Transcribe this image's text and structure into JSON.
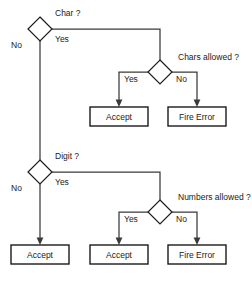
{
  "diagram": {
    "type": "flowchart",
    "background_color": "#ffffff",
    "line_color": "#3a3a3a",
    "shape_stroke_color": "#1a1a1a",
    "decisions": [
      {
        "id": "char",
        "label": "Char ?",
        "shape": "diamond"
      },
      {
        "id": "chars_allowed",
        "label": "Chars allowed ?",
        "shape": "diamond"
      },
      {
        "id": "digit",
        "label": "Digit ?",
        "shape": "diamond"
      },
      {
        "id": "numbers_allowed",
        "label": "Numbers allowed ?",
        "shape": "diamond"
      }
    ],
    "terminals": [
      {
        "id": "accept_chars",
        "label": "Accept",
        "shape": "rect"
      },
      {
        "id": "fire_error_chars",
        "label": "Fire Error",
        "shape": "rect"
      },
      {
        "id": "accept_no_digit",
        "label": "Accept",
        "shape": "rect"
      },
      {
        "id": "accept_numbers",
        "label": "Accept",
        "shape": "rect"
      },
      {
        "id": "fire_error_numbers",
        "label": "Fire Error",
        "shape": "rect"
      }
    ],
    "edges": [
      {
        "from": "char",
        "to": "digit",
        "label": "No"
      },
      {
        "from": "char",
        "to": "chars_allowed",
        "label": "Yes"
      },
      {
        "from": "chars_allowed",
        "to": "accept_chars",
        "label": "Yes"
      },
      {
        "from": "chars_allowed",
        "to": "fire_error_chars",
        "label": "No"
      },
      {
        "from": "digit",
        "to": "accept_no_digit",
        "label": "No"
      },
      {
        "from": "digit",
        "to": "numbers_allowed",
        "label": "Yes"
      },
      {
        "from": "numbers_allowed",
        "to": "accept_numbers",
        "label": "Yes"
      },
      {
        "from": "numbers_allowed",
        "to": "fire_error_numbers",
        "label": "No"
      }
    ],
    "labels": {
      "char_question": "Char ?",
      "chars_allowed_question": "Chars allowed ?",
      "digit_question": "Digit ?",
      "numbers_allowed_question": "Numbers allowed ?",
      "char_no": "No",
      "char_yes": "Yes",
      "chars_allowed_yes": "Yes",
      "chars_allowed_no": "No",
      "digit_no": "No",
      "digit_yes": "Yes",
      "numbers_allowed_yes": "Yes",
      "numbers_allowed_no": "No",
      "accept_chars": "Accept",
      "fire_error_chars": "Fire Error",
      "accept_no_digit": "Accept",
      "accept_numbers": "Accept",
      "fire_error_numbers": "Fire Error"
    }
  }
}
